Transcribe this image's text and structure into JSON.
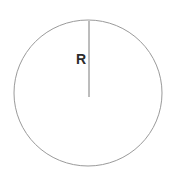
{
  "figure": {
    "type": "geometry-diagram",
    "background_color": "#ffffff"
  },
  "labels": {
    "radius": "R"
  },
  "shapes": {
    "circle": {
      "name": "circle-outline",
      "center_x": 88,
      "center_y": 93,
      "radius_x": 74,
      "radius_y": 73,
      "stroke_color": "#9a9a9a",
      "stroke_width": 1,
      "fill": "none"
    },
    "radius_line": {
      "name": "radius-line",
      "x1": 89,
      "y1": 21,
      "x2": 89,
      "y2": 97,
      "stroke_color": "#7a7a7a",
      "stroke_width": 1
    }
  },
  "chart_data": {
    "type": "scatter",
    "title": "",
    "xlabel": "",
    "ylabel": "",
    "annotations": [
      "R"
    ],
    "series": [
      {
        "name": "circle-outline",
        "shape": "ellipse",
        "center": [
          88,
          93
        ],
        "radii": [
          74,
          73
        ]
      },
      {
        "name": "radius-segment",
        "shape": "line",
        "points": [
          [
            89,
            21
          ],
          [
            89,
            97
          ]
        ],
        "label": "R"
      }
    ]
  }
}
